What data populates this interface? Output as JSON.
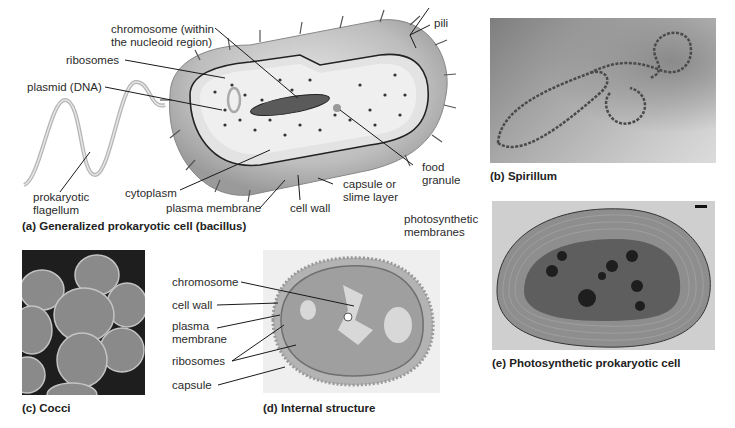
{
  "panels": {
    "a": {
      "caption": "(a) Generalized prokaryotic cell (bacillus)",
      "labels": {
        "chromosome": "chromosome (within",
        "chromosome2": "the nucleoid region)",
        "ribosomes": "ribosomes",
        "plasmid": "plasmid (DNA)",
        "pili": "pili",
        "flagellum1": "prokaryotic",
        "flagellum2": "flagellum",
        "cytoplasm": "cytoplasm",
        "plasma_membrane": "plasma membrane",
        "cell_wall": "cell wall",
        "capsule1": "capsule or",
        "capsule2": "slime layer",
        "food1": "food",
        "food2": "granule"
      }
    },
    "b": {
      "caption": "(b) Spirillum"
    },
    "c": {
      "caption": "(c) Cocci"
    },
    "d": {
      "caption": "(d) Internal structure",
      "labels": {
        "chromosome": "chromosome",
        "cell_wall": "cell wall",
        "plasma1": "plasma",
        "plasma2": "membrane",
        "ribosomes": "ribosomes",
        "capsule": "capsule"
      }
    },
    "e": {
      "caption": "(e) Photosynthetic prokaryotic cell",
      "labels": {
        "photo1": "photosynthetic",
        "photo2": "membranes"
      }
    }
  },
  "colors": {
    "line": "#1a1a1a",
    "cell_outer": "#c8c8c8",
    "cytoplasm": "#ececec",
    "photo_bg": "#9a9a9a"
  }
}
